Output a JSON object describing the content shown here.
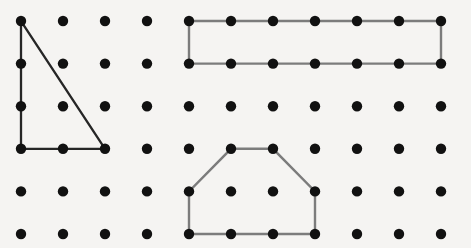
{
  "canvas": {
    "width": 471,
    "height": 248,
    "background_color": "#f5f4f2",
    "title": "Geoboard dot grid with three polygons"
  },
  "grid": {
    "name": "dot-grid",
    "columns": 11,
    "rows": 6,
    "origin_x": 21,
    "origin_y": 21,
    "spacing_x": 42.0,
    "spacing_y": 42.6,
    "dot_radius": 5.2,
    "dot_color": "#111111"
  },
  "shapes": [
    {
      "name": "right-triangle",
      "label": "Right triangle",
      "stroke_color": "#262626",
      "stroke_width": 2.3,
      "closed": true,
      "vertices_grid": [
        [
          0,
          0
        ],
        [
          0,
          3
        ],
        [
          2,
          3
        ]
      ]
    },
    {
      "name": "rectangle",
      "label": "Rectangle",
      "stroke_color": "#7c7c7c",
      "stroke_width": 2.4,
      "closed": true,
      "vertices_grid": [
        [
          4,
          0
        ],
        [
          10,
          0
        ],
        [
          10,
          1
        ],
        [
          4,
          1
        ]
      ]
    },
    {
      "name": "hexagon",
      "label": "Hexagon",
      "stroke_color": "#7c7c7c",
      "stroke_width": 2.4,
      "closed": true,
      "vertices_grid": [
        [
          5,
          3
        ],
        [
          6,
          3
        ],
        [
          7,
          4
        ],
        [
          7,
          5
        ],
        [
          4,
          5
        ],
        [
          4,
          4
        ]
      ]
    }
  ]
}
